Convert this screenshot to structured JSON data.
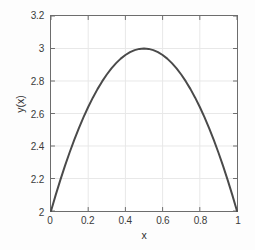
{
  "figure": {
    "background_color": "#fdfdfd",
    "plot_background_color": "#ffffff",
    "axis_color": "#6d6d6d",
    "grid_color": "#e8e8e8",
    "curve_color": "#4a4a4a",
    "tick_label_color": "#3b3b3b"
  },
  "chart_data": {
    "type": "line",
    "title": "",
    "subtitle": "",
    "xlabel": "x",
    "ylabel": "y(x)",
    "xlim": [
      0,
      1
    ],
    "ylim": [
      2,
      3.2
    ],
    "grid": true,
    "legend": null,
    "legend_position": "none",
    "xticks": [
      0,
      0.2,
      0.4,
      0.6,
      0.8,
      1
    ],
    "xtick_labels": [
      "0",
      "0.2",
      "0.4",
      "0.6",
      "0.8",
      "1"
    ],
    "yticks": [
      2,
      2.2,
      2.4,
      2.6,
      2.8,
      3,
      3.2
    ],
    "ytick_labels": [
      "2",
      "2.2",
      "2.4",
      "2.6",
      "2.8",
      "3",
      "3.2"
    ],
    "annotations": [],
    "series": [
      {
        "name": "y(x)",
        "color": "#4a4a4a",
        "line_width": 2,
        "formula": "y = 2 + 4x(1 - x)",
        "x": [
          0,
          0.025,
          0.05,
          0.075,
          0.1,
          0.125,
          0.15,
          0.175,
          0.2,
          0.225,
          0.25,
          0.275,
          0.3,
          0.325,
          0.35,
          0.375,
          0.4,
          0.425,
          0.45,
          0.475,
          0.5,
          0.525,
          0.55,
          0.575,
          0.6,
          0.625,
          0.65,
          0.675,
          0.7,
          0.725,
          0.75,
          0.775,
          0.8,
          0.825,
          0.85,
          0.875,
          0.9,
          0.925,
          0.95,
          0.975,
          1
        ],
        "values": [
          2,
          2.0975,
          2.19,
          2.2775,
          2.36,
          2.4375,
          2.51,
          2.5775,
          2.64,
          2.6975,
          2.75,
          2.7975,
          2.84,
          2.8775,
          2.91,
          2.9375,
          2.96,
          2.9775,
          2.99,
          2.9975,
          3,
          2.9975,
          2.99,
          2.9775,
          2.96,
          2.9375,
          2.91,
          2.8775,
          2.84,
          2.7975,
          2.75,
          2.6975,
          2.64,
          2.5775,
          2.51,
          2.4375,
          2.36,
          2.2775,
          2.19,
          2.0975,
          2
        ]
      }
    ]
  }
}
